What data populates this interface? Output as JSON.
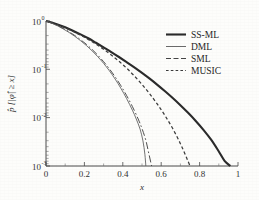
{
  "chart_data": {
    "type": "line",
    "title": "",
    "subtitle": "",
    "xlabel": "x",
    "ylabel": "p̂ [|φ̂| ≥ x]",
    "ylabel_parts": {
      "p_hat": "p̂",
      "bracket_open": "[",
      "phi_hat": "φ̂",
      "ge": "≥",
      "x": "x",
      "bracket_close": "]"
    },
    "xlim": [
      0,
      1
    ],
    "ylim": [
      0.001,
      1
    ],
    "yscale": "log",
    "xscale": "linear",
    "grid": false,
    "legend_position": "upper-right-inside",
    "xticks": [
      0,
      0.2,
      0.4,
      0.6,
      0.8,
      1
    ],
    "xticklabels": [
      "0",
      "0.2",
      "0.4",
      "0.6",
      "0.8",
      "1"
    ],
    "yticks": [
      1,
      0.1,
      0.01,
      0.001
    ],
    "yticklabels": [
      "10",
      "10",
      "10",
      "10"
    ],
    "ytick_exponents": [
      "0",
      "-1",
      "-2",
      "-3"
    ],
    "series": [
      {
        "name": "SS-ML",
        "style": "solid-thick",
        "color": "#2b2b2b",
        "x": [
          0.0,
          0.03,
          0.06,
          0.1,
          0.14,
          0.18,
          0.22,
          0.26,
          0.3,
          0.34,
          0.38,
          0.42,
          0.46,
          0.5,
          0.54,
          0.58,
          0.62,
          0.66,
          0.7,
          0.74,
          0.78,
          0.82,
          0.86,
          0.9,
          0.93,
          0.96
        ],
        "y": [
          1.0,
          0.93,
          0.85,
          0.74,
          0.63,
          0.53,
          0.44,
          0.355,
          0.285,
          0.228,
          0.18,
          0.141,
          0.11,
          0.0845,
          0.064,
          0.0478,
          0.0352,
          0.0255,
          0.0181,
          0.0126,
          0.00855,
          0.0056,
          0.0035,
          0.002,
          0.00128,
          0.001
        ]
      },
      {
        "name": "DML",
        "style": "solid-thin",
        "color": "#5a5a5a",
        "x": [
          0.0,
          0.03,
          0.06,
          0.09,
          0.12,
          0.15,
          0.18,
          0.21,
          0.24,
          0.27,
          0.3,
          0.33,
          0.36,
          0.39,
          0.42,
          0.45,
          0.47,
          0.49,
          0.505,
          0.515,
          0.52
        ],
        "y": [
          1.0,
          0.9,
          0.795,
          0.685,
          0.58,
          0.482,
          0.392,
          0.312,
          0.242,
          0.182,
          0.133,
          0.0935,
          0.063,
          0.0405,
          0.0248,
          0.0143,
          0.0094,
          0.0058,
          0.0033,
          0.00175,
          0.001
        ]
      },
      {
        "name": "SML",
        "style": "dash-dot",
        "color": "#454545",
        "x": [
          0.0,
          0.03,
          0.06,
          0.09,
          0.12,
          0.15,
          0.18,
          0.21,
          0.24,
          0.27,
          0.3,
          0.33,
          0.36,
          0.39,
          0.42,
          0.45,
          0.48,
          0.5,
          0.52,
          0.535,
          0.55
        ],
        "y": [
          1.0,
          0.905,
          0.805,
          0.7,
          0.598,
          0.5,
          0.41,
          0.33,
          0.258,
          0.196,
          0.144,
          0.1025,
          0.07,
          0.0458,
          0.0286,
          0.017,
          0.0094,
          0.00595,
          0.0034,
          0.00185,
          0.001
        ]
      },
      {
        "name": "MUSIC",
        "style": "dotted",
        "color": "#3c3c3c",
        "x": [
          0.0,
          0.03,
          0.06,
          0.1,
          0.14,
          0.18,
          0.22,
          0.26,
          0.3,
          0.34,
          0.38,
          0.42,
          0.46,
          0.5,
          0.54,
          0.58,
          0.62,
          0.66,
          0.7,
          0.73,
          0.75
        ],
        "y": [
          1.0,
          0.925,
          0.84,
          0.725,
          0.612,
          0.508,
          0.415,
          0.332,
          0.26,
          0.198,
          0.147,
          0.1055,
          0.073,
          0.0487,
          0.0312,
          0.019,
          0.011,
          0.00595,
          0.0029,
          0.00155,
          0.001
        ]
      }
    ],
    "legend": [
      {
        "label": "SS-ML",
        "style": "solid-thick"
      },
      {
        "label": "DML",
        "style": "solid-thin"
      },
      {
        "label": "SML",
        "style": "dash-dot"
      },
      {
        "label": "MUSIC",
        "style": "dotted"
      }
    ]
  }
}
